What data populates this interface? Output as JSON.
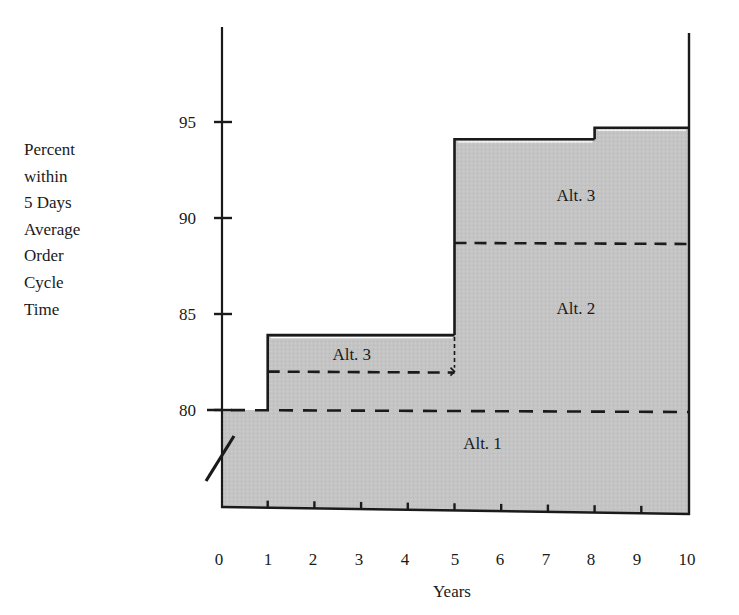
{
  "chart_data": {
    "type": "area",
    "subtype": "step",
    "title": "",
    "xlabel": "Years",
    "ylabel_lines": [
      "Percent",
      "within",
      "5 Days",
      "Average",
      "Order",
      "Cycle",
      "Time"
    ],
    "ylabel": "Percent within 5 Days Average Order Cycle Time",
    "x_ticks": [
      0,
      1,
      2,
      3,
      4,
      5,
      6,
      7,
      8,
      9,
      10
    ],
    "y_ticks": [
      80,
      85,
      90,
      95
    ],
    "xlim": [
      0,
      10
    ],
    "ylim": [
      75,
      100
    ],
    "y_axis_break": true,
    "grid": false,
    "legend": null,
    "fill_color": "#c4c4c4",
    "line_color": "#1a1a1a",
    "series": [
      {
        "name": "Total (solid step outline)",
        "style": "solid",
        "points": [
          {
            "x_start": 0,
            "x_end": 1,
            "y": 80.0
          },
          {
            "x_start": 1,
            "x_end": 5,
            "y": 83.9
          },
          {
            "x_start": 5,
            "x_end": 8,
            "y": 94.1
          },
          {
            "x_start": 8,
            "x_end": 10,
            "y": 94.7
          }
        ]
      },
      {
        "name": "Alt. 1 level (dashed)",
        "style": "dashed",
        "points": [
          {
            "x_start": 0,
            "x_end": 10,
            "y": 80.0
          }
        ]
      },
      {
        "name": "Alt. 2 level years 1-5 (dashed, arrow at year 5)",
        "style": "dashed",
        "points": [
          {
            "x_start": 1,
            "x_end": 5,
            "y": 82.0
          }
        ]
      },
      {
        "name": "Alt. 2 level years 5-10 (dashed)",
        "style": "dashed",
        "points": [
          {
            "x_start": 5,
            "x_end": 10,
            "y": 88.7
          }
        ]
      }
    ],
    "annotations": [
      {
        "text": "Alt. 1",
        "x": 5.6,
        "y": 78.3
      },
      {
        "text": "Alt. 3",
        "x": 2.8,
        "y": 82.9
      },
      {
        "text": "Alt. 2",
        "x": 7.6,
        "y": 85.3
      },
      {
        "text": "Alt. 3",
        "x": 7.6,
        "y": 91.2
      }
    ]
  }
}
